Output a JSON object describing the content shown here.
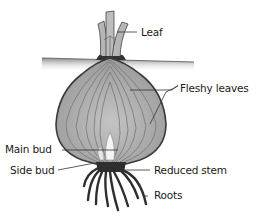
{
  "diagram": {
    "labels": {
      "leaf": "Leaf",
      "fleshy_leaves": "Fleshy leaves",
      "main_bud": "Main bud",
      "side_bud": "Side bud",
      "reduced_stem": "Reduced stem",
      "roots": "Roots"
    },
    "colors": {
      "soil": "#8c8c8c",
      "bulb_fill": "#a9a9a9",
      "bulb_outline": "#3a3a3a",
      "stem": "#2e2e2e",
      "leaf_fill": "#b8b8b8",
      "bud": "#f2f2f2"
    }
  }
}
